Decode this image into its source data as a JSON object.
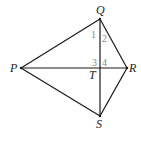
{
  "diagram": {
    "type": "kite geometry figure",
    "points": {
      "P": {
        "label": "P",
        "x": 21,
        "y": 68
      },
      "Q": {
        "label": "Q",
        "x": 100,
        "y": 19
      },
      "R": {
        "label": "R",
        "x": 127,
        "y": 68
      },
      "S": {
        "label": "S",
        "x": 100,
        "y": 116
      },
      "T": {
        "label": "T",
        "x": 100,
        "y": 68
      }
    },
    "segments": [
      "PQ",
      "QR",
      "RS",
      "SP",
      "PR",
      "QS"
    ],
    "angle_labels": [
      {
        "label": "1",
        "x": 94,
        "y": 38
      },
      {
        "label": "2",
        "x": 104,
        "y": 42
      },
      {
        "label": "3",
        "x": 94,
        "y": 65
      },
      {
        "label": "4",
        "x": 104,
        "y": 65
      }
    ]
  }
}
